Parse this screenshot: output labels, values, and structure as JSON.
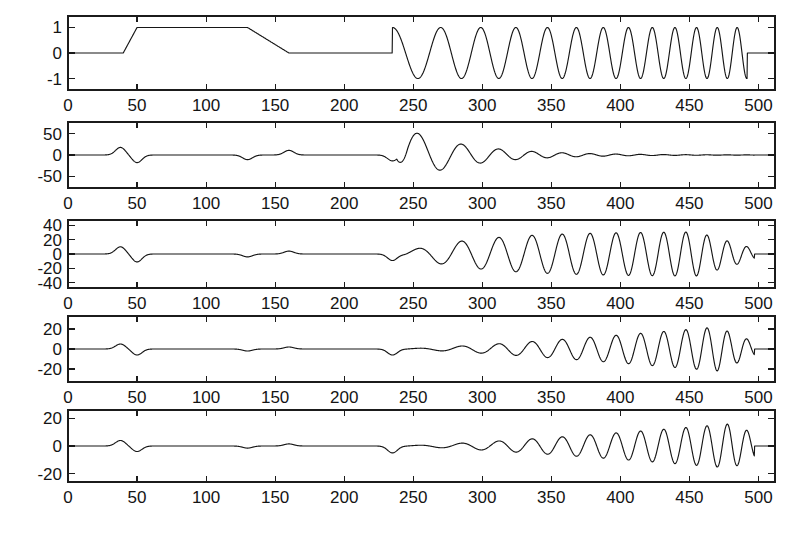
{
  "figure": {
    "title": "",
    "background_color": "#ffffff",
    "line_color": "#161616",
    "axis_color": "#1b1b1b",
    "panel_count": 5
  },
  "chart_data": [
    {
      "type": "line",
      "title": "",
      "panel_index": 0,
      "panel_name": "original-signal",
      "xlabel": "",
      "ylabel": "",
      "xlim": [
        0,
        512
      ],
      "ylim": [
        -1.45,
        1.45
      ],
      "xticks": [
        0,
        50,
        100,
        150,
        200,
        250,
        300,
        350,
        400,
        450,
        500
      ],
      "xtick_labels": [
        "0",
        "50",
        "100",
        "150",
        "200",
        "250",
        "300",
        "350",
        "400",
        "450",
        "500"
      ],
      "yticks": [
        1,
        0,
        -1
      ],
      "ytick_labels": [
        "1",
        "0",
        "-1"
      ],
      "grid": false,
      "legend": null,
      "description": "Trapezoidal plateau pulse from 40 to 160 followed by a linear chirp of unit amplitude from 235 to 492",
      "segments": [
        {
          "kind": "constant",
          "x_start": 0,
          "x_end": 40,
          "value": 0
        },
        {
          "kind": "ramp_up",
          "x_start": 40,
          "x_end": 50,
          "from": 0,
          "to": 1
        },
        {
          "kind": "constant",
          "x_start": 50,
          "x_end": 130,
          "value": 1
        },
        {
          "kind": "ramp_down",
          "x_start": 130,
          "x_end": 160,
          "from": 1,
          "to": 0
        },
        {
          "kind": "constant",
          "x_start": 160,
          "x_end": 235,
          "value": 0
        },
        {
          "kind": "chirp",
          "x_start": 235,
          "x_end": 492,
          "amplitude": 1,
          "f_start": 0.0255,
          "f_end": 0.072
        },
        {
          "kind": "constant",
          "x_start": 492,
          "x_end": 512,
          "value": 0
        }
      ]
    },
    {
      "type": "line",
      "title": "",
      "panel_index": 1,
      "panel_name": "decomposition-level-1",
      "xlabel": "",
      "ylabel": "",
      "xlim": [
        0,
        512
      ],
      "ylim": [
        -78,
        78
      ],
      "xticks": [
        0,
        50,
        100,
        150,
        200,
        250,
        300,
        350,
        400,
        450,
        500
      ],
      "xtick_labels": [
        "0",
        "50",
        "100",
        "150",
        "200",
        "250",
        "300",
        "350",
        "400",
        "450",
        "500"
      ],
      "yticks": [
        50,
        0,
        -50
      ],
      "ytick_labels": [
        "50",
        "0",
        "-50"
      ],
      "grid": false,
      "legend": null,
      "description": "Low-scale response: small edge transients near 40 and 160, large burst peaking near 50 to -65 at 250-280 then decaying toward zero by 400",
      "edge_bumps": [
        {
          "center": 38,
          "amplitude": 18
        },
        {
          "center": 50,
          "amplitude": -18
        },
        {
          "center": 130,
          "amplitude": -11
        },
        {
          "center": 160,
          "amplitude": 11
        },
        {
          "center": 235,
          "amplitude": -14
        }
      ],
      "burst": {
        "start": 238,
        "end": 500,
        "peak_value": 55,
        "peak_x": 250,
        "decay": "fast"
      }
    },
    {
      "type": "line",
      "title": "",
      "panel_index": 2,
      "panel_name": "decomposition-level-2",
      "xlabel": "",
      "ylabel": "",
      "xlim": [
        0,
        512
      ],
      "ylim": [
        -47,
        47
      ],
      "xticks": [
        0,
        50,
        100,
        150,
        200,
        250,
        300,
        350,
        400,
        450,
        500
      ],
      "xtick_labels": [
        "0",
        "50",
        "100",
        "150",
        "200",
        "250",
        "300",
        "350",
        "400",
        "450",
        "500"
      ],
      "yticks": [
        40,
        20,
        0,
        -20,
        -40
      ],
      "ytick_labels": [
        "40",
        "20",
        "0",
        "-20",
        "-40"
      ],
      "grid": false,
      "legend": null,
      "description": "Mid-scale response: small edge transients, oscillation growing after 235 to about 30 amplitude across 320-450 then tapering near 495",
      "edge_bumps": [
        {
          "center": 38,
          "amplitude": 10
        },
        {
          "center": 50,
          "amplitude": -11
        },
        {
          "center": 130,
          "amplitude": -4
        },
        {
          "center": 160,
          "amplitude": 4
        },
        {
          "center": 235,
          "amplitude": -9
        }
      ],
      "burst": {
        "start": 238,
        "end": 500,
        "peak_value": 31,
        "peak_x": 350,
        "decay": "plateau"
      }
    },
    {
      "type": "line",
      "title": "",
      "panel_index": 3,
      "panel_name": "decomposition-level-3",
      "xlabel": "",
      "ylabel": "",
      "xlim": [
        0,
        512
      ],
      "ylim": [
        -33,
        33
      ],
      "xticks": [
        0,
        50,
        100,
        150,
        200,
        250,
        300,
        350,
        400,
        450,
        500
      ],
      "xtick_labels": [
        "0",
        "50",
        "100",
        "150",
        "200",
        "250",
        "300",
        "350",
        "400",
        "450",
        "500"
      ],
      "yticks": [
        20,
        0,
        -20
      ],
      "ytick_labels": [
        "20",
        "0",
        "-20"
      ],
      "grid": false,
      "legend": null,
      "description": "Higher-scale response: tiny edge transients, oscillation steadily growing after 235 reaching about 22 amplitude near 460-490",
      "edge_bumps": [
        {
          "center": 38,
          "amplitude": 5
        },
        {
          "center": 50,
          "amplitude": -6
        },
        {
          "center": 130,
          "amplitude": -2
        },
        {
          "center": 160,
          "amplitude": 2
        },
        {
          "center": 235,
          "amplitude": -6
        }
      ],
      "burst": {
        "start": 238,
        "end": 500,
        "peak_value": 22,
        "peak_x": 470,
        "decay": "growing"
      }
    },
    {
      "type": "line",
      "title": "",
      "panel_index": 4,
      "panel_name": "decomposition-level-4",
      "xlabel": "",
      "ylabel": "",
      "xlim": [
        0,
        512
      ],
      "ylim": [
        -26,
        26
      ],
      "xticks": [
        0,
        50,
        100,
        150,
        200,
        250,
        300,
        350,
        400,
        450,
        500
      ],
      "xtick_labels": [
        "0",
        "50",
        "100",
        "150",
        "200",
        "250",
        "300",
        "350",
        "400",
        "450",
        "500"
      ],
      "yticks": [
        20,
        0,
        -20
      ],
      "ytick_labels": [
        "20",
        "0",
        "-20"
      ],
      "grid": false,
      "legend": null,
      "description": "Highest-scale response: minimal edge transients, oscillation growing after 235 reaching about 16 amplitude near 480",
      "edge_bumps": [
        {
          "center": 38,
          "amplitude": 4
        },
        {
          "center": 50,
          "amplitude": -4
        },
        {
          "center": 130,
          "amplitude": -1.5
        },
        {
          "center": 160,
          "amplitude": 1.5
        },
        {
          "center": 235,
          "amplitude": -5
        }
      ],
      "burst": {
        "start": 238,
        "end": 500,
        "peak_value": 16,
        "peak_x": 480,
        "decay": "growing"
      }
    }
  ]
}
